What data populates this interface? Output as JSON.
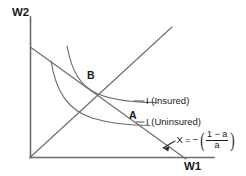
{
  "figure": {
    "axes": {
      "y_label": "W2",
      "x_label": "W1"
    },
    "points": [
      {
        "name": "B",
        "label": "B"
      },
      {
        "name": "A",
        "label": "A"
      }
    ],
    "curves": [
      {
        "name": "indifference-curve-insured",
        "label": "I (Insured)"
      },
      {
        "name": "indifference-curve-uninsured",
        "label": "I (Uninsured)"
      }
    ],
    "slope_annotation": {
      "variable": "X",
      "equals": "=",
      "minus": "−",
      "open_paren": "(",
      "numerator": "1 − a",
      "denominator": "a",
      "close_paren": ")"
    },
    "colors": {
      "ink": "#1a1a1a",
      "line": "#555555",
      "background": "#ffffff"
    }
  }
}
